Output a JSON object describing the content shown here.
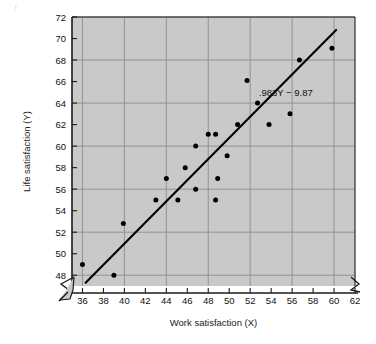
{
  "figure": {
    "background_color": "#ffffff",
    "plot_fill_color": "#c9c9c9",
    "grid_color": "#8d8d8d",
    "axis_color": "#1a1a1a",
    "point_color": "#000000",
    "line_color": "#000000",
    "corner_mark": "↑"
  },
  "chart_data": {
    "type": "scatter",
    "title": "",
    "xlabel": "Work satisfaction (X)",
    "ylabel": "Life satisfaction (Y)",
    "xlim": [
      35,
      62
    ],
    "ylim": [
      47,
      72
    ],
    "xticks": [
      36,
      38,
      40,
      42,
      44,
      46,
      48,
      50,
      52,
      54,
      56,
      58,
      60,
      62
    ],
    "yticks": [
      48,
      50,
      52,
      54,
      56,
      58,
      60,
      62,
      64,
      66,
      68,
      70,
      72
    ],
    "xtick_labels": [
      "36",
      "38",
      "40",
      "42",
      "44",
      "46",
      "48",
      "50",
      "52",
      "54",
      "56",
      "58",
      "60",
      "62"
    ],
    "ytick_labels": [
      "48",
      "50",
      "52",
      "54",
      "56",
      "58",
      "60",
      "62",
      "64",
      "66",
      "68",
      "70",
      "72"
    ],
    "grid": true,
    "grid_x": [
      36,
      40,
      44,
      48,
      52,
      56,
      60
    ],
    "grid_y": [
      48,
      52,
      56,
      60,
      64,
      68,
      72
    ],
    "axis_break_x": true,
    "axis_break_y": true,
    "legend": "none",
    "annotations": [
      {
        "text": ".983Y − 9.87",
        "x": 55.4,
        "y": 64.7,
        "name": "regression-equation-label"
      }
    ],
    "points": [
      {
        "x": 36.0,
        "y": 49.0
      },
      {
        "x": 39.0,
        "y": 48.0
      },
      {
        "x": 39.9,
        "y": 52.8
      },
      {
        "x": 43.0,
        "y": 55.0
      },
      {
        "x": 44.0,
        "y": 57.0
      },
      {
        "x": 45.1,
        "y": 55.0
      },
      {
        "x": 45.8,
        "y": 58.0
      },
      {
        "x": 46.8,
        "y": 56.0
      },
      {
        "x": 46.8,
        "y": 60.0
      },
      {
        "x": 48.0,
        "y": 61.1
      },
      {
        "x": 48.7,
        "y": 61.1
      },
      {
        "x": 48.7,
        "y": 55.0
      },
      {
        "x": 48.9,
        "y": 57.0
      },
      {
        "x": 49.8,
        "y": 59.1
      },
      {
        "x": 50.8,
        "y": 62.0
      },
      {
        "x": 51.7,
        "y": 66.1
      },
      {
        "x": 52.7,
        "y": 64.0
      },
      {
        "x": 53.8,
        "y": 62.0
      },
      {
        "x": 55.8,
        "y": 63.0
      },
      {
        "x": 56.7,
        "y": 68.0
      },
      {
        "x": 59.8,
        "y": 69.1
      }
    ],
    "fit_line": {
      "name": "regression-line",
      "x1": 36.3,
      "y1": 47.3,
      "x2": 60.2,
      "y2": 70.8,
      "slope": 0.983,
      "intercept": -9.87,
      "equation": ".983Y − 9.87"
    }
  }
}
